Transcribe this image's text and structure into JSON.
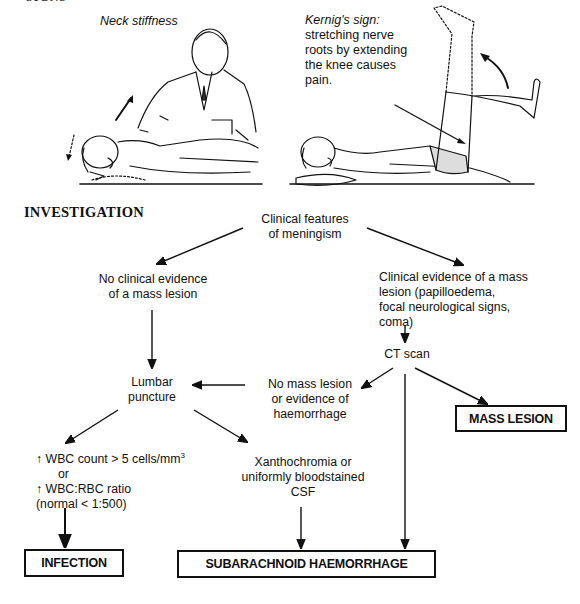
{
  "section_top_partial": "SIGNS",
  "illustrations": {
    "neck": {
      "caption": "Neck stiffness"
    },
    "kernig": {
      "caption_title": "Kernig's sign:",
      "caption_lines": [
        "stretching nerve",
        "roots by extending",
        "the knee causes",
        "pain."
      ]
    }
  },
  "investigation": {
    "heading": "INVESTIGATION",
    "nodes": {
      "start": [
        "Clinical features",
        "of meningism"
      ],
      "no_mass": [
        "No clinical evidence",
        "of a mass lesion"
      ],
      "mass": [
        "Clinical evidence of a mass",
        "lesion (papilloedema,",
        "focal neurological signs,",
        "coma)"
      ],
      "ct": "CT scan",
      "no_mass_ct": [
        "No mass lesion",
        "or evidence of",
        "haemorrhage"
      ],
      "lp": [
        "Lumbar",
        "puncture"
      ],
      "wbc": {
        "line1_prefix": "↑ WBC count > 5 cells/mm",
        "line1_sup": "3",
        "line2": "or",
        "line3": "↑ WBC:RBC ratio",
        "line4": "(normal < 1:500)"
      },
      "xantho": [
        "Xanthochromia or",
        "uniformly bloodstained",
        "CSF"
      ]
    },
    "outcomes": {
      "mass_lesion": "MASS LESION",
      "infection": "INFECTION",
      "sah": "SUBARACHNOID HAEMORRHAGE"
    }
  }
}
